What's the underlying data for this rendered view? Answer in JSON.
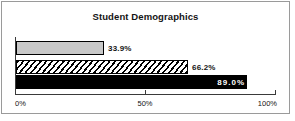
{
  "chart_data": {
    "type": "bar",
    "orientation": "horizontal",
    "title": "Student Demographics",
    "xlabel": "",
    "ylabel": "",
    "xlim": [
      0,
      100
    ],
    "grid": false,
    "legend": "none",
    "categories": [
      "Series 1",
      "Series 2",
      "Series 3"
    ],
    "values": [
      33.9,
      66.2,
      89.0
    ],
    "data_labels": [
      "33.9%",
      "66.2%",
      "89.0%"
    ],
    "bars": [
      {
        "value": 33.9,
        "label": "33.9%",
        "fill": "gray",
        "label_position": "outside"
      },
      {
        "value": 66.2,
        "label": "66.2%",
        "fill": "hatch",
        "label_position": "outside"
      },
      {
        "value": 89.0,
        "label": "89.0%",
        "fill": "black",
        "label_position": "inside"
      }
    ],
    "xticks": [
      0,
      50,
      100
    ],
    "xtick_labels": [
      "0%",
      "50%",
      "100%"
    ]
  },
  "colors": {
    "frame_border": "#9a9a9a",
    "axis": "#3a3a3a",
    "bar_gray": "#c8c8c8",
    "bar_black": "#000000",
    "bar_outline": "#000000",
    "text": "#141414",
    "label_inside_text": "#ffffff",
    "background": "#ffffff"
  }
}
